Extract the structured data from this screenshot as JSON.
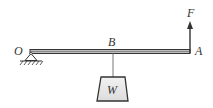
{
  "diagram": {
    "type": "lever-mechanics",
    "labels": {
      "pivot": "O",
      "load_point": "B",
      "end_point": "A",
      "force": "F",
      "weight": "W"
    },
    "colors": {
      "stroke": "#333333",
      "beam_fill": "#9a9a9a",
      "weight_fill": "#e6e6e6",
      "string": "#777777"
    }
  }
}
